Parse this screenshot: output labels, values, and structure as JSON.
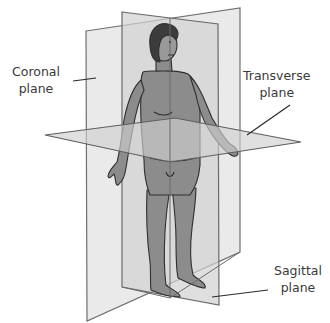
{
  "diagram": {
    "colors": {
      "background": "#ffffff",
      "plane_fill": "#d9d9d9",
      "plane_edge": "#6e6e6e",
      "body_fill": "#8a8a8a",
      "body_outline": "#2f2f2f",
      "hair": "#3c3c3c",
      "label_text": "#3a3a3a",
      "leader_line": "#2a2a2a"
    },
    "planes": [
      {
        "id": "coronal",
        "lines": [
          "Coronal",
          "plane"
        ]
      },
      {
        "id": "transverse",
        "lines": [
          "Transverse",
          "plane"
        ]
      },
      {
        "id": "sagittal",
        "lines": [
          "Sagittal",
          "plane"
        ]
      }
    ],
    "figure": {
      "subject": "standing human figure (female), anatomical position"
    }
  }
}
